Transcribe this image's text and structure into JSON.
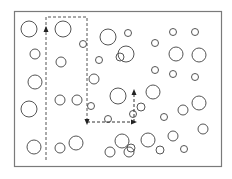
{
  "diagram": {
    "title": "",
    "colors": {
      "frame": "#7a7a7a",
      "particle": "#555555",
      "path": "#333333",
      "background": "#ffffff"
    },
    "particle_count": 44,
    "path_arrows": [
      "up",
      "down",
      "right",
      "up"
    ]
  }
}
